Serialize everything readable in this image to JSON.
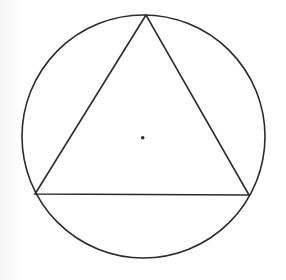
{
  "diagram": {
    "canvas": {
      "width": 286,
      "height": 280,
      "background": "#ffffff"
    },
    "stroke_color": "#2b2b2b",
    "stroke_width": 1.6,
    "circle": {
      "cx": 143.5,
      "cy": 136.5,
      "r": 121.5
    },
    "triangle": {
      "vertices": [
        {
          "label": "top",
          "x": 146,
          "y": 15
        },
        {
          "label": "bottom-left",
          "x": 35,
          "y": 194
        },
        {
          "label": "bottom-right",
          "x": 249,
          "y": 195
        }
      ]
    },
    "center_point": {
      "cx": 142.7,
      "cy": 137.7,
      "r": 1.8
    }
  }
}
